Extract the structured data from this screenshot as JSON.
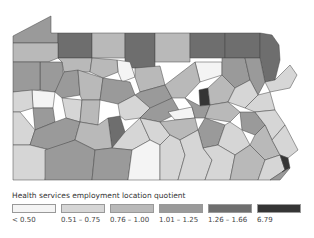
{
  "map": {
    "region": "Pennsylvania counties",
    "classes": [
      {
        "label": "< 0.50",
        "color": "#f4f4f4"
      },
      {
        "label": "0.51 – 0.75",
        "color": "#d6d6d6"
      },
      {
        "label": "0.76 – 1.00",
        "color": "#b9b9b9"
      },
      {
        "label": "1.01 – 1.25",
        "color": "#9a9a9a"
      },
      {
        "label": "1.26 – 1.66",
        "color": "#6e6e6e"
      },
      {
        "label": "6.79",
        "color": "#353535"
      }
    ]
  },
  "legend": {
    "title": "Health services employment location quotient",
    "labels": [
      "< 0.50",
      "0.51 – 0.75",
      "0.76 – 1.00",
      "1.01 – 1.25",
      "1.26 – 1.66",
      "6.79"
    ]
  }
}
